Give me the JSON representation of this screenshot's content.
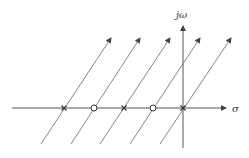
{
  "diagram": {
    "type": "root-locus",
    "axes": {
      "imaginary_label": "jω",
      "real_label": "σ"
    },
    "markers": [
      {
        "type": "pole",
        "symbol": "×",
        "x": 64
      },
      {
        "type": "zero",
        "symbol": "○",
        "x": 94
      },
      {
        "type": "pole",
        "symbol": "×",
        "x": 124
      },
      {
        "type": "zero",
        "symbol": "○",
        "x": 153
      },
      {
        "type": "pole",
        "symbol": "×",
        "x": 183
      }
    ],
    "locus_lines": 5,
    "colors": {
      "axis": "#555555",
      "locus": "#777777",
      "marker": "#333333"
    }
  }
}
